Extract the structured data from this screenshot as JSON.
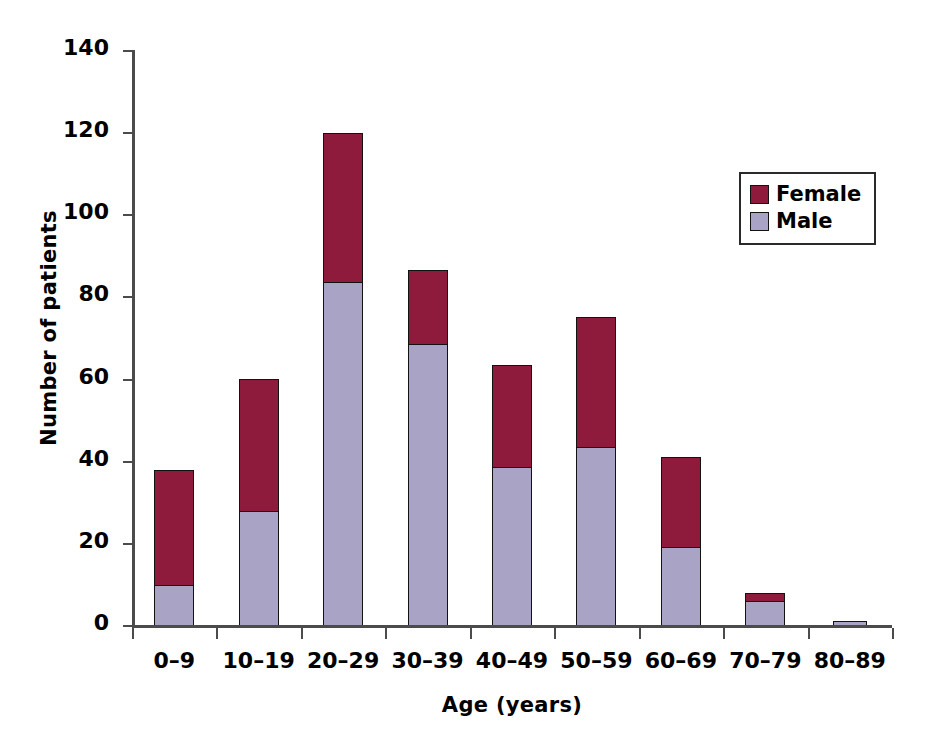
{
  "chart_data": {
    "type": "bar",
    "subtype": "stacked-vertical",
    "title": "",
    "xlabel": "Age (years)",
    "ylabel": "Number of patients",
    "categories": [
      "0–9",
      "10–19",
      "20–29",
      "30–39",
      "40–49",
      "50–59",
      "60–69",
      "70–79",
      "80–89"
    ],
    "series": [
      {
        "name": "Male",
        "color": "#a9a4c6",
        "values": [
          9.5,
          27.7,
          83.5,
          68.3,
          38.3,
          43.2,
          18.8,
          5.9,
          0.9
        ]
      },
      {
        "name": "Female",
        "color": "#8e1b3c",
        "values": [
          28.2,
          32.1,
          36.2,
          18.2,
          25.1,
          31.8,
          22.2,
          1.9,
          0
        ]
      }
    ],
    "totals": [
      37.7,
      59.8,
      119.7,
      86.5,
      63.4,
      75.0,
      41.0,
      7.8,
      0.9
    ],
    "stack_order": [
      "Male",
      "Female"
    ],
    "ylim": [
      0,
      140
    ],
    "yticks": [
      0,
      20,
      40,
      60,
      80,
      100,
      120,
      140
    ],
    "ytick_labels": [
      "0",
      "20",
      "40",
      "60",
      "80",
      "100",
      "120",
      "140"
    ],
    "grid": false,
    "legend_position": "upper right",
    "legend_entries": [
      "Female",
      "Male"
    ]
  },
  "legend": {
    "items": [
      {
        "label": "Female",
        "color": "#8e1b3c"
      },
      {
        "label": "Male",
        "color": "#a9a4c6"
      }
    ]
  },
  "axes": {
    "x_title": "Age (years)",
    "y_title": "Number of patients"
  },
  "colors": {
    "female": "#8e1b3c",
    "male": "#a9a4c6",
    "axis": "#4b4b4b",
    "outline": "#121212",
    "background": "#ffffff"
  }
}
